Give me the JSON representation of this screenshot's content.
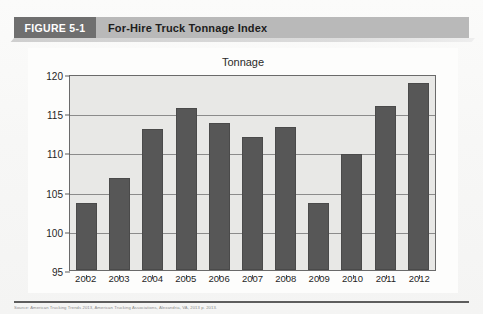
{
  "figure": {
    "tag": "FIGURE 5-1",
    "title": "For-Hire Truck Tonnage Index"
  },
  "caption": "Source: American Trucking Trends 2013, American Trucking Associations, Alexandria, VA, 2013 p. 2013.",
  "chart_data": {
    "type": "bar",
    "title": "Tonnage",
    "xlabel": "",
    "ylabel": "",
    "categories": [
      "2002",
      "2003",
      "2004",
      "2005",
      "2006",
      "2007",
      "2008",
      "2009",
      "2010",
      "2011",
      "2012"
    ],
    "values": [
      103.5,
      106.7,
      113.0,
      115.7,
      113.8,
      112.0,
      113.3,
      103.5,
      109.8,
      115.9,
      118.8
    ],
    "ylim": [
      95,
      120
    ],
    "yticks": [
      95,
      100,
      105,
      110,
      115,
      120
    ],
    "grid": true,
    "legend": false,
    "bar_color": "#575757",
    "plot_background": "#e8e8e6"
  }
}
